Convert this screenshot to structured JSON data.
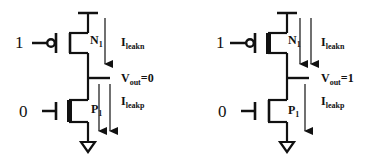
{
  "diagram": {
    "type": "CMOS inverter leakage current diagram",
    "colors": {
      "stroke": "#111111",
      "background": "#ffffff"
    },
    "circuits": [
      {
        "id": "left",
        "input_top": "1",
        "input_bottom": "0",
        "nmos_label": {
          "main": "N",
          "sub": "1"
        },
        "pmos_label": {
          "main": "P",
          "sub": "1"
        },
        "ileakn": {
          "main": "I",
          "sub": "leakn"
        },
        "ileakp": {
          "main": "I",
          "sub": "leakp"
        },
        "vout": {
          "main": "V",
          "sub": "out",
          "value": "=0"
        },
        "thick_channel": "bottom",
        "arrows_top": 1,
        "arrows_bottom": 2
      },
      {
        "id": "right",
        "input_top": "1",
        "input_bottom": "0",
        "nmos_label": {
          "main": "N",
          "sub": "1"
        },
        "pmos_label": {
          "main": "P",
          "sub": "1"
        },
        "ileakn": {
          "main": "I",
          "sub": "leakn"
        },
        "ileakp": {
          "main": "I",
          "sub": "leakp"
        },
        "vout": {
          "main": "V",
          "sub": "out",
          "value": "=1"
        },
        "thick_channel": "top",
        "arrows_top": 2,
        "arrows_bottom": 1
      }
    ]
  }
}
